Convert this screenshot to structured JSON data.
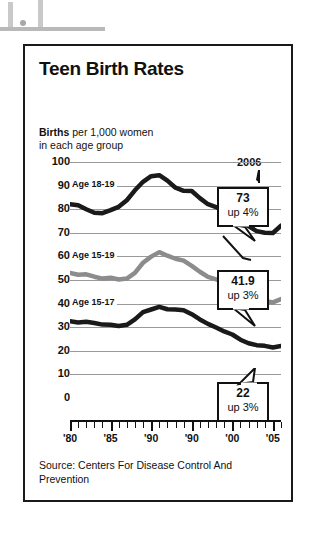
{
  "card": {
    "title": "Teen Birth Rates",
    "subtitle_bold": "Births",
    "subtitle_rest": " per 1,000 women",
    "subtitle_line2": "in each age group",
    "source": "Source: Centers For Disease Control And Prevention",
    "year_annotation": "2006"
  },
  "callouts": [
    {
      "value": "73",
      "change": "up 4%"
    },
    {
      "value": "41.9",
      "change": "up 3%"
    },
    {
      "value": "22",
      "change": "up 3%"
    }
  ],
  "series_labels": {
    "s1": "Age 18-19",
    "s2": "Age 15-19",
    "s3": "Age 15-17"
  },
  "colors": {
    "series_18_19": "#1a1a1a",
    "series_15_19": "#8c8c8c",
    "series_15_17": "#1a1a1a",
    "grid": "#9a9a9a",
    "border": "#1a1a1a"
  },
  "chart_data": {
    "type": "line",
    "title": "Teen Birth Rates",
    "subtitle": "Births per 1,000 women in each age group",
    "xlabel": "",
    "ylabel": "Births per 1,000 women",
    "ylim": [
      0,
      100
    ],
    "yticks": [
      0,
      10,
      20,
      30,
      40,
      50,
      60,
      70,
      80,
      90,
      100
    ],
    "xlim": [
      1980,
      2006
    ],
    "xticks": [
      1980,
      1985,
      1990,
      1995,
      2000,
      2005
    ],
    "xticklabels": [
      "'80",
      "'85",
      "'90",
      "'90",
      "'00",
      "'05"
    ],
    "grid": true,
    "legend": "inline-labels",
    "annotations": [
      "2006",
      "73 up 4%",
      "41.9 up 3%",
      "22 up 3%"
    ],
    "x": [
      1980,
      1981,
      1982,
      1983,
      1984,
      1985,
      1986,
      1987,
      1988,
      1989,
      1990,
      1991,
      1992,
      1993,
      1994,
      1995,
      1996,
      1997,
      1998,
      1999,
      2000,
      2001,
      2002,
      2003,
      2004,
      2005,
      2006
    ],
    "series": [
      {
        "name": "Age 18-19",
        "color": "#1a1a1a",
        "end_label": "73",
        "end_change": "up 4%",
        "values": [
          82.1,
          81.7,
          80.0,
          78.5,
          78.3,
          79.6,
          81.0,
          83.8,
          88.0,
          91.6,
          94.0,
          94.4,
          92.1,
          89.1,
          87.8,
          87.7,
          84.7,
          82.1,
          80.9,
          79.1,
          78.1,
          76.1,
          72.8,
          70.7,
          70.0,
          69.9,
          73.0
        ]
      },
      {
        "name": "Age 15-19",
        "color": "#8c8c8c",
        "end_label": "41.9",
        "end_change": "up 3%",
        "values": [
          53.0,
          52.2,
          52.4,
          51.4,
          50.6,
          51.0,
          50.2,
          50.6,
          53.0,
          57.3,
          59.9,
          61.8,
          60.3,
          59.0,
          58.2,
          56.0,
          53.5,
          51.3,
          50.3,
          48.8,
          47.7,
          45.3,
          43.0,
          41.6,
          41.1,
          40.5,
          41.9
        ]
      },
      {
        "name": "Age 15-17",
        "color": "#1a1a1a",
        "end_label": "22",
        "end_change": "up 3%",
        "values": [
          32.5,
          32.0,
          32.3,
          31.8,
          31.1,
          31.0,
          30.5,
          31.0,
          33.3,
          36.4,
          37.5,
          38.6,
          37.6,
          37.5,
          37.2,
          35.5,
          33.3,
          31.4,
          29.9,
          28.2,
          26.9,
          24.7,
          23.2,
          22.4,
          22.1,
          21.4,
          22.0
        ]
      }
    ]
  }
}
